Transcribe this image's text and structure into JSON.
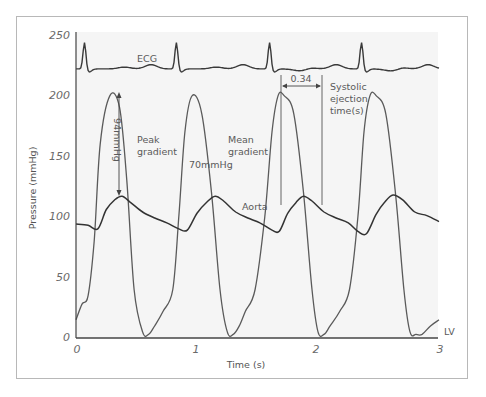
{
  "chart_data": {
    "type": "line",
    "title": "",
    "xlabel": "Time (s)",
    "ylabel": "Pressure (mmHg)",
    "xlim": [
      0,
      3
    ],
    "ylim": [
      0,
      250
    ],
    "x_ticks": [
      "0",
      "1",
      "2",
      "3"
    ],
    "y_ticks": [
      "0",
      "50",
      "100",
      "150",
      "200",
      "250"
    ],
    "grid": false,
    "series": [
      {
        "name": "ECG",
        "note": "Schematic ECG trace drawn across top of plot (offset, not in mmHg)",
        "r_peaks_s": [
          0.07,
          0.83,
          1.6,
          2.36
        ],
        "baseline_level": 222
      },
      {
        "name": "LV",
        "x": [
          0.0,
          0.05,
          0.1,
          0.15,
          0.2,
          0.28,
          0.36,
          0.42,
          0.48,
          0.55,
          0.6,
          0.65,
          0.72,
          0.8,
          0.85,
          0.9,
          0.96,
          1.04,
          1.12,
          1.19,
          1.25,
          1.3,
          1.35,
          1.4,
          1.48,
          1.56,
          1.62,
          1.67,
          1.72,
          1.8,
          1.88,
          1.95,
          2.0,
          2.05,
          2.1,
          2.18,
          2.26,
          2.33,
          2.38,
          2.43,
          2.48,
          2.56,
          2.64,
          2.71,
          2.76,
          2.81,
          2.86,
          2.93,
          3.0
        ],
        "values": [
          15,
          28,
          35,
          80,
          160,
          200,
          190,
          130,
          40,
          5,
          3,
          10,
          22,
          40,
          100,
          170,
          200,
          185,
          120,
          40,
          5,
          3,
          10,
          22,
          40,
          100,
          170,
          200,
          200,
          185,
          120,
          40,
          5,
          3,
          10,
          22,
          40,
          100,
          170,
          200,
          200,
          185,
          120,
          40,
          5,
          3,
          3,
          10,
          15
        ],
        "label": "LV"
      },
      {
        "name": "Aorta",
        "x": [
          0.0,
          0.1,
          0.18,
          0.25,
          0.32,
          0.38,
          0.45,
          0.55,
          0.65,
          0.75,
          0.85,
          0.92,
          1.0,
          1.08,
          1.15,
          1.22,
          1.32,
          1.42,
          1.52,
          1.62,
          1.68,
          1.75,
          1.82,
          1.88,
          1.95,
          2.05,
          2.15,
          2.25,
          2.33,
          2.4,
          2.48,
          2.55,
          2.62,
          2.7,
          2.8,
          2.9,
          3.0
        ],
        "values": [
          94,
          93,
          90,
          106,
          114,
          117,
          112,
          104,
          99,
          95,
          90,
          89,
          103,
          112,
          117,
          113,
          104,
          99,
          95,
          89,
          88,
          103,
          112,
          117,
          113,
          104,
          99,
          95,
          88,
          86,
          102,
          112,
          118,
          114,
          104,
          101,
          96
        ],
        "label": "Aorta"
      }
    ],
    "annotations": [
      {
        "text": "ECG",
        "x": 0.75,
        "y": 228
      },
      {
        "text": "94mmHg",
        "orientation": "vertical",
        "x": 0.38,
        "y_from": 200,
        "y_to": 117,
        "note": "Peak-to-peak arrow"
      },
      {
        "text": "Peak gradient",
        "x": 0.48,
        "y": 155
      },
      {
        "text": "70mmHg",
        "x": 0.98,
        "y": 150
      },
      {
        "text": "Mean gradient",
        "x": 1.28,
        "y": 155
      },
      {
        "text": "Aorta",
        "x": 1.38,
        "y": 107
      },
      {
        "text": "0.34",
        "x": 1.84,
        "y": 206,
        "note": "Horizontal arrow between ejection start and end"
      },
      {
        "text": "Systolic ejection time(s)",
        "x": 2.07,
        "y": 198
      },
      {
        "text": "LV",
        "x": 3.06,
        "y": 5
      }
    ]
  },
  "axes": {
    "x_title": "Time (s)",
    "y_title": "Pressure (mmHg)",
    "x_ticks": [
      "0",
      "1",
      "2",
      "3"
    ],
    "y_ticks": [
      "0",
      "50",
      "100",
      "150",
      "200",
      "250"
    ]
  },
  "labels": {
    "ecg": "ECG",
    "peak_value": "94mmHg",
    "peak_line1": "Peak",
    "peak_line2": "gradient",
    "mean_value": "70mmHg",
    "mean_line1": "Mean",
    "mean_line2": "gradient",
    "aorta": "Aorta",
    "set_value": "0.34",
    "set_line1": "Systolic",
    "set_line2": "ejection",
    "set_line3": "time(s)",
    "lv": "LV"
  },
  "colors": {
    "trace": "#3a3a3a",
    "lv_trace": "#555555",
    "axis": "#444444",
    "plot_bg": "#f4f4f4",
    "frame": "#b8b8b8",
    "text": "#5a5a5a"
  }
}
